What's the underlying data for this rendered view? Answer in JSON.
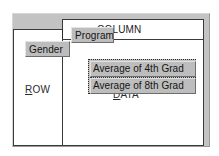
{
  "dialog": {
    "name": "pivot-table-layout",
    "background_color": "#c3c3c3",
    "drop_area_color": "#ffffff",
    "button_face_color": "#bdbdbd"
  },
  "drop_areas": {
    "column": {
      "label": "COLUMN",
      "accel": "C",
      "label_rest": "OLUMN"
    },
    "row": {
      "label": "ROW",
      "accel": "R",
      "label_rest": "OW"
    },
    "data": {
      "label": "DATA",
      "accel": "D",
      "label_rest": "ATA"
    }
  },
  "fields": {
    "column_field": {
      "label": "Program"
    },
    "row_field": {
      "label": "Gender"
    },
    "data_fields": [
      {
        "label": "Average of 4th Grad"
      },
      {
        "label": "Average of 8th Grad"
      }
    ],
    "data_fields_selected": true
  }
}
